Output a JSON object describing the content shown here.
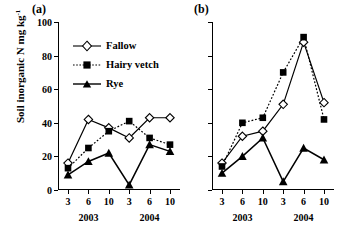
{
  "figure": {
    "ylabel": "Soil inorganic N mg kg",
    "ylabel_sup": "-1",
    "panel_a_label": "(a)",
    "panel_b_label": "(b)"
  },
  "legend": {
    "position": "upper-left-panel-a",
    "items": [
      {
        "label": "Fallow",
        "marker": "open-diamond",
        "line": "solid",
        "color": "#000000"
      },
      {
        "label": "Hairy vetch",
        "marker": "filled-square",
        "line": "dotted",
        "color": "#000000"
      },
      {
        "label": "Rye",
        "marker": "filled-triangle",
        "line": "solid",
        "color": "#000000"
      }
    ]
  },
  "axes": {
    "yticks": [
      0,
      20,
      40,
      60,
      80,
      100
    ],
    "yticklabels": [
      "0",
      "20",
      "40",
      "60",
      "80",
      "100"
    ],
    "ylim": [
      0,
      100
    ],
    "xticklabels": [
      "3",
      "6",
      "10",
      "3",
      "6",
      "10"
    ],
    "group_labels": [
      "2003",
      "2004"
    ],
    "grid": false
  },
  "chart_data": [
    {
      "type": "line",
      "panel": "(a)",
      "title": "(a)",
      "xlabel": "",
      "ylabel": "Soil inorganic N mg kg-1",
      "ylim": [
        0,
        100
      ],
      "grid": false,
      "legend_position": "upper left",
      "categories": [
        "3",
        "6",
        "10",
        "3",
        "6",
        "10"
      ],
      "group_labels": [
        "2003",
        "2003",
        "2003",
        "2004",
        "2004",
        "2004"
      ],
      "series": [
        {
          "name": "Fallow",
          "marker": "open-diamond",
          "line": "solid",
          "values": [
            16,
            42,
            37,
            31,
            43,
            43
          ]
        },
        {
          "name": "Hairy vetch",
          "marker": "filled-square",
          "line": "dotted",
          "values": [
            13,
            25,
            35,
            41,
            31,
            27
          ]
        },
        {
          "name": "Rye",
          "marker": "filled-triangle",
          "line": "solid",
          "values": [
            9,
            17,
            22,
            3,
            27,
            23
          ]
        }
      ]
    },
    {
      "type": "line",
      "panel": "(b)",
      "title": "(b)",
      "xlabel": "",
      "ylabel": "Soil inorganic N mg kg-1",
      "ylim": [
        0,
        100
      ],
      "grid": false,
      "categories": [
        "3",
        "6",
        "10",
        "3",
        "6",
        "10"
      ],
      "group_labels": [
        "2003",
        "2003",
        "2003",
        "2004",
        "2004",
        "2004"
      ],
      "series": [
        {
          "name": "Fallow",
          "marker": "open-diamond",
          "line": "solid",
          "values": [
            16,
            32,
            35,
            51,
            88,
            52
          ]
        },
        {
          "name": "Hairy vetch",
          "marker": "filled-square",
          "line": "dotted",
          "values": [
            14,
            40,
            43,
            70,
            91,
            42
          ]
        },
        {
          "name": "Rye",
          "marker": "filled-triangle",
          "line": "solid",
          "values": [
            10,
            20,
            31,
            5,
            25,
            18
          ]
        }
      ]
    }
  ]
}
